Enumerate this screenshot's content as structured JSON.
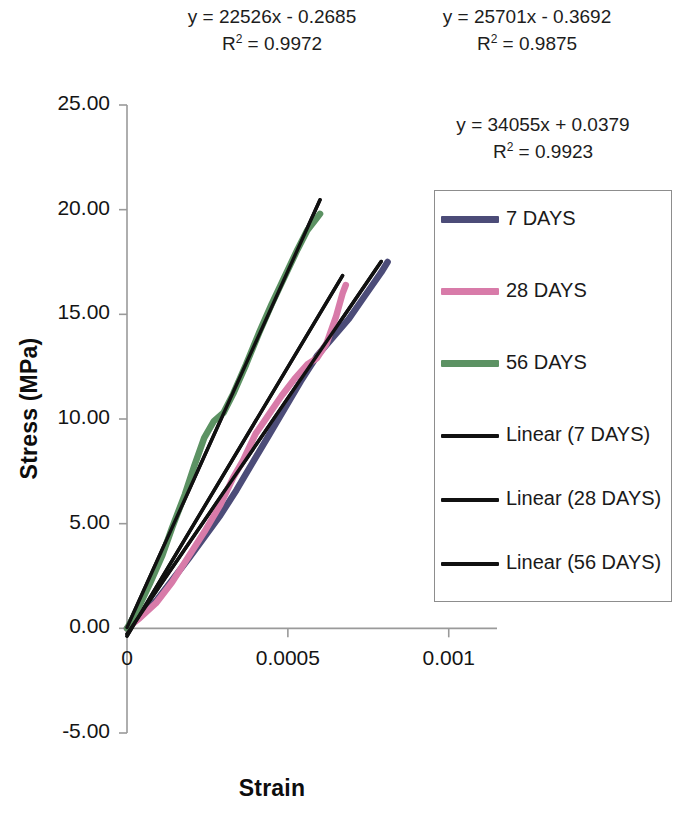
{
  "chart_data": {
    "type": "line",
    "title": "",
    "xlabel": "Strain",
    "ylabel": "Stress (MPa)",
    "xlim": [
      0,
      0.00115
    ],
    "ylim": [
      -5,
      25
    ],
    "xticks": [
      "0",
      "0.0005",
      "0.001"
    ],
    "xtick_values": [
      0,
      0.0005,
      0.001
    ],
    "yticks": [
      "25.00",
      "20.00",
      "15.00",
      "10.00",
      "5.00",
      "0.00",
      "-5.00"
    ],
    "ytick_values": [
      25,
      20,
      15,
      10,
      5,
      0,
      -5
    ],
    "grid": false,
    "legend_position": "right",
    "series": [
      {
        "name": "7 DAYS",
        "color": "#4c4c78",
        "kind": "data",
        "points": [
          [
            0.0,
            0.0
          ],
          [
            4e-05,
            0.55
          ],
          [
            9e-05,
            1.3
          ],
          [
            0.00014,
            2.3
          ],
          [
            0.00019,
            3.3
          ],
          [
            0.00024,
            4.35
          ],
          [
            0.00029,
            5.4
          ],
          [
            0.00034,
            6.6
          ],
          [
            0.00039,
            7.9
          ],
          [
            0.00044,
            9.2
          ],
          [
            0.00049,
            10.5
          ],
          [
            0.00054,
            11.8
          ],
          [
            0.00059,
            13.0
          ],
          [
            0.00064,
            13.9
          ],
          [
            0.00069,
            14.8
          ],
          [
            0.00074,
            15.9
          ],
          [
            0.00079,
            17.0
          ],
          [
            0.00081,
            17.5
          ]
        ]
      },
      {
        "name": "28 DAYS",
        "color": "#d87ba9",
        "kind": "data",
        "points": [
          [
            0.0,
            0.0
          ],
          [
            4e-05,
            0.5
          ],
          [
            9e-05,
            1.2
          ],
          [
            0.00014,
            2.2
          ],
          [
            0.00019,
            3.4
          ],
          [
            0.00024,
            4.6
          ],
          [
            0.00029,
            5.9
          ],
          [
            0.00033,
            7.2
          ],
          [
            0.00036,
            8.0
          ],
          [
            0.0004,
            9.3
          ],
          [
            0.00044,
            10.2
          ],
          [
            0.00048,
            11.1
          ],
          [
            0.00052,
            11.9
          ],
          [
            0.00056,
            12.6
          ],
          [
            0.00059,
            12.9
          ],
          [
            0.00062,
            13.6
          ],
          [
            0.00065,
            14.9
          ],
          [
            0.00067,
            16.0
          ],
          [
            0.00068,
            16.4
          ]
        ]
      },
      {
        "name": "56 DAYS",
        "color": "#5c9263",
        "kind": "data",
        "points": [
          [
            0.0,
            0.0
          ],
          [
            3e-05,
            0.8
          ],
          [
            7e-05,
            2.1
          ],
          [
            0.00011,
            3.5
          ],
          [
            0.00014,
            4.8
          ],
          [
            0.00018,
            6.4
          ],
          [
            0.00021,
            7.8
          ],
          [
            0.00024,
            9.1
          ],
          [
            0.00027,
            9.9
          ],
          [
            0.0003,
            10.3
          ],
          [
            0.00033,
            11.2
          ],
          [
            0.00037,
            12.6
          ],
          [
            0.00041,
            14.1
          ],
          [
            0.00045,
            15.5
          ],
          [
            0.00049,
            16.8
          ],
          [
            0.00053,
            18.1
          ],
          [
            0.00056,
            19.0
          ],
          [
            0.00059,
            19.6
          ],
          [
            0.0006,
            19.8
          ]
        ]
      },
      {
        "name": "Linear (7 DAYS)",
        "color": "#111111",
        "kind": "trend",
        "slope": 22526,
        "intercept": -0.2685,
        "x_from": 0.0,
        "x_to": 0.00079
      },
      {
        "name": "Linear (28 DAYS)",
        "color": "#111111",
        "kind": "trend",
        "slope": 25701,
        "intercept": -0.3692,
        "x_from": 0.0,
        "x_to": 0.00067
      },
      {
        "name": "Linear (56 DAYS)",
        "color": "#111111",
        "kind": "trend",
        "slope": 34055,
        "intercept": 0.0379,
        "x_from": 0.0,
        "x_to": 0.0006
      }
    ],
    "annotations": [
      {
        "id": "eq7",
        "equation": "y = 22526x - 0.2685",
        "r2": "R² = 0.9972",
        "r2_prefix": "R",
        "r2_sup": "2",
        "r2_value": "= 0.9972"
      },
      {
        "id": "eq28",
        "equation": "y = 25701x - 0.3692",
        "r2": "R² = 0.9875",
        "r2_prefix": "R",
        "r2_sup": "2",
        "r2_value": "= 0.9875"
      },
      {
        "id": "eq56",
        "equation": "y = 34055x + 0.0379",
        "r2": "R² = 0.9923",
        "r2_prefix": "R",
        "r2_sup": "2",
        "r2_value": "= 0.9923"
      }
    ]
  },
  "equations": {
    "eq7": {
      "line1": "y = 22526x - 0.2685",
      "r_prefix": "R",
      "r_sup": "2",
      "r_rest": " = 0.9972"
    },
    "eq28": {
      "line1": "y = 25701x - 0.3692",
      "r_prefix": "R",
      "r_sup": "2",
      "r_rest": " = 0.9875"
    },
    "eq56": {
      "line1": "y = 34055x + 0.0379",
      "r_prefix": "R",
      "r_sup": "2",
      "r_rest": " = 0.9923"
    }
  },
  "axes": {
    "y_title": "Stress (MPa)",
    "x_title": "Strain",
    "y_labels": [
      "25.00",
      "20.00",
      "15.00",
      "10.00",
      "5.00",
      "0.00",
      "-5.00"
    ],
    "x_labels": [
      "0",
      "0.0005",
      "0.001"
    ]
  },
  "legend": {
    "items": [
      {
        "label": "7 DAYS",
        "color": "#4c4c78",
        "style": "thick"
      },
      {
        "label": "28 DAYS",
        "color": "#d87ba9",
        "style": "thick"
      },
      {
        "label": "56 DAYS",
        "color": "#5c9263",
        "style": "thick"
      },
      {
        "label": "Linear (7 DAYS)",
        "color": "#111111",
        "style": "thin"
      },
      {
        "label": "Linear (28 DAYS)",
        "color": "#111111",
        "style": "thin"
      },
      {
        "label": "Linear (56 DAYS)",
        "color": "#111111",
        "style": "thin"
      }
    ]
  }
}
